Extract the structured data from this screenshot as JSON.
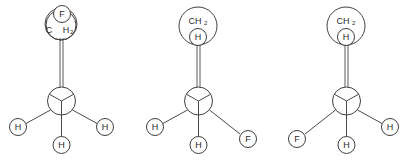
{
  "figure": {
    "type": "newman-projection-set",
    "count": 3,
    "background_color": "#ffffff",
    "line_color": "#3f3f3f",
    "text_color": "#2b2b2b"
  },
  "structures": [
    {
      "id": "structure-1",
      "left_px": 0,
      "rear_group": {
        "style": "split-overlap",
        "upper_label": "F",
        "lower_label_main": "C",
        "lower_label_element": "H",
        "lower_label_subscript": "2"
      },
      "front_substituents": {
        "left": "H",
        "bottom": "H",
        "right": "H"
      }
    },
    {
      "id": "structure-2",
      "left_px": 138,
      "rear_group": {
        "style": "stacked",
        "upper_label_main": "CH",
        "upper_label_subscript": "2",
        "lower_label": "H"
      },
      "front_substituents": {
        "left": "H",
        "bottom": "H",
        "right": "F"
      }
    },
    {
      "id": "structure-3",
      "left_px": 275,
      "rear_group": {
        "style": "stacked",
        "upper_label_main": "CH",
        "upper_label_subscript": "2",
        "lower_label": "H"
      },
      "front_substituents": {
        "left": "F",
        "bottom": "H",
        "right": "H"
      }
    }
  ],
  "artifacts": {
    "bottom_right_smudge": "....."
  }
}
